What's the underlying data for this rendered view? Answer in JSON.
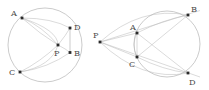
{
  "image": {
    "width": 209,
    "height": 90,
    "background_color": "#ffffff",
    "kind": "geometry-diagram-pair"
  },
  "style": {
    "curve_color": "#a8a8a8",
    "curve_color_faint": "#bdbdbd",
    "point_color": "#2a2a2a",
    "label_color": "#4a4a4a"
  },
  "figures": [
    {
      "id": "left",
      "name": "point-inside-circle",
      "circle": {
        "cx": 45,
        "cy": 45,
        "r": 37
      },
      "points": [
        {
          "id": "A",
          "label": "A",
          "x": 22,
          "y": 18,
          "label_x": 11,
          "label_y": 16
        },
        {
          "id": "D",
          "label": "D",
          "x": 70,
          "y": 28,
          "label_x": 74,
          "label_y": 30
        },
        {
          "id": "P",
          "label": "P",
          "x": 58,
          "y": 45,
          "label_x": 54,
          "label_y": 56
        },
        {
          "id": "B",
          "label": "B",
          "x": 70,
          "y": 52.5,
          "label_x": 74,
          "label_y": 56
        },
        {
          "id": "C",
          "label": "C",
          "x": 20,
          "y": 72,
          "label_x": 9,
          "label_y": 75
        }
      ],
      "segments": [
        {
          "from": "D",
          "to": "B",
          "name": "chord-DB"
        }
      ],
      "arcs": [
        {
          "name": "arc-A-to-P-upper",
          "d": "M 22 18 Q 42 26 58 45"
        },
        {
          "name": "arc-A-to-D",
          "d": "M 22 18 Q 52 18 70 28"
        },
        {
          "name": "arc-A-to-P-lower",
          "d": "M 22 18 Q 40 34 58 45"
        },
        {
          "name": "arc-C-to-P",
          "d": "M 20 72 Q 40 62 58 45"
        },
        {
          "name": "arc-C-to-B",
          "d": "M 20 72 Q 48 68 70 52.5"
        },
        {
          "name": "arc-P-to-D",
          "d": "M 58 45 Q 66 35 70 28"
        },
        {
          "name": "arc-P-to-B",
          "d": "M 58 45 Q 66 49 70 52.5"
        },
        {
          "name": "arc-A-to-C-left",
          "d": "M 22 18 Q 5 45 20 72"
        },
        {
          "name": "ellipse-A-P-C",
          "d": "M 22 18 Q 58 30 58 45 Q 52 66 20 72"
        }
      ]
    },
    {
      "id": "right",
      "name": "point-outside-circle",
      "circle": {
        "cx": 167,
        "cy": 44,
        "r": 33
      },
      "points": [
        {
          "id": "P",
          "label": "P",
          "x": 100,
          "y": 42,
          "label_x": 93,
          "label_y": 38
        },
        {
          "id": "A",
          "label": "A",
          "x": 137,
          "y": 33,
          "label_x": 130,
          "label_y": 30
        },
        {
          "id": "B",
          "label": "B",
          "x": 188,
          "y": 15,
          "label_x": 191,
          "label_y": 12
        },
        {
          "id": "C",
          "label": "C",
          "x": 137,
          "y": 57,
          "label_x": 129,
          "label_y": 67
        },
        {
          "id": "D",
          "label": "D",
          "x": 188,
          "y": 73,
          "label_x": 189,
          "label_y": 85
        }
      ],
      "segments": [
        {
          "from": "P",
          "to": "B",
          "name": "secant-PAB",
          "extend": 12
        },
        {
          "from": "P",
          "to": "D",
          "name": "secant-PCD",
          "extend": 12
        },
        {
          "from": "P",
          "to": "A",
          "name": "segment-PA"
        },
        {
          "from": "P",
          "to": "C",
          "name": "segment-PC"
        },
        {
          "from": "A",
          "to": "C",
          "name": "chord-AC"
        },
        {
          "from": "A",
          "to": "D",
          "name": "chord-AD"
        },
        {
          "from": "C",
          "to": "B",
          "name": "chord-CB"
        }
      ],
      "arcs": [
        {
          "name": "arc-P-to-B-upper",
          "d": "M 100 42 Q 140 6 188 15"
        },
        {
          "name": "arc-P-to-D-lower",
          "d": "M 100 42 Q 142 82 188 73"
        },
        {
          "name": "arc-A-to-B",
          "d": "M 137 33 Q 162 20 188 15"
        },
        {
          "name": "arc-C-to-D",
          "d": "M 137 57 Q 163 70 188 73"
        },
        {
          "name": "arc-A-to-C-bulge",
          "d": "M 137 33 Q 131 45 137 57"
        }
      ]
    }
  ]
}
